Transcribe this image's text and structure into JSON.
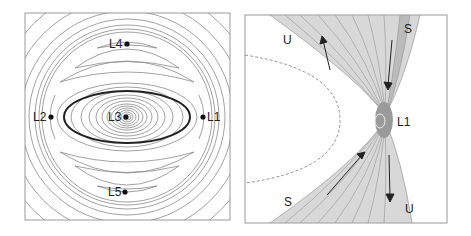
{
  "left_panel": {
    "points": [
      {
        "label": "L4",
        "x": 127,
        "y": 44
      },
      {
        "label": "L2",
        "x": 51,
        "y": 117
      },
      {
        "label": "L3",
        "x": 126,
        "y": 117
      },
      {
        "label": "L1",
        "x": 203,
        "y": 117
      },
      {
        "label": "L5",
        "x": 125,
        "y": 192
      }
    ]
  },
  "right_panel": {
    "labels": [
      {
        "text": "U",
        "x": 283,
        "y": 44
      },
      {
        "text": "S",
        "x": 408,
        "y": 33
      },
      {
        "text": "L1",
        "x": 398,
        "y": 126
      },
      {
        "text": "S",
        "x": 288,
        "y": 206
      },
      {
        "text": "U",
        "x": 405,
        "y": 213
      }
    ]
  },
  "colors": {
    "contour": "#8a8a8a",
    "ellipse": "#222222",
    "frame": "#999999"
  }
}
